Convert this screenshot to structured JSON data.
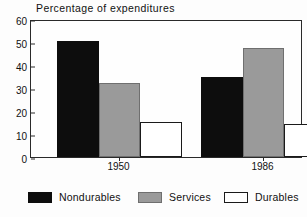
{
  "chart_data": {
    "type": "bar",
    "title": "Percentage of expenditures",
    "xlabel": "",
    "ylabel": "",
    "ylim": [
      0,
      60
    ],
    "yticks": [
      0,
      10,
      20,
      30,
      40,
      50,
      60
    ],
    "ytick_labels": [
      "0",
      "10",
      "20",
      "30",
      "40",
      "50",
      "60"
    ],
    "grid": false,
    "legend_position": "bottom",
    "categories": [
      "1950",
      "1986"
    ],
    "series": [
      {
        "name": "Nondurables",
        "color": "#0d0d0d",
        "fill": "black",
        "values": [
          50.5,
          34.7
        ]
      },
      {
        "name": "Services",
        "color": "#9a9a9a",
        "fill": "gray",
        "values": [
          32.3,
          47.5
        ]
      },
      {
        "name": "Durables",
        "color": "#ffffff",
        "fill": "white",
        "values": [
          15.2,
          14.2
        ]
      }
    ]
  },
  "legend": {
    "entries": [
      {
        "label": "Nondurables",
        "swatch": "black"
      },
      {
        "label": "Services",
        "swatch": "gray"
      },
      {
        "label": "Durables",
        "swatch": "white"
      }
    ]
  },
  "colors": {
    "nondurables": "#0d0d0d",
    "services": "#9a9a9a",
    "durables": "#ffffff",
    "axis": "#2a2a2a",
    "text": "#111111",
    "background": "#fdfdfd"
  }
}
